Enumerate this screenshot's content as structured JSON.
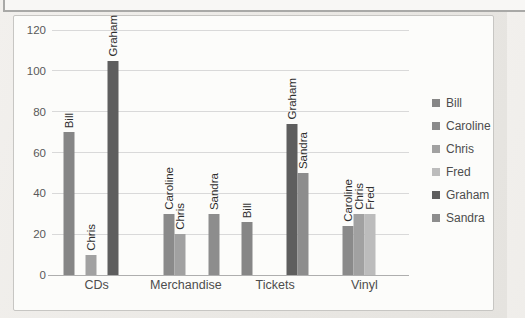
{
  "chart_data": {
    "type": "bar",
    "title": "",
    "xlabel": "",
    "ylabel": "",
    "categories": [
      "CDs",
      "Merchandise",
      "Tickets",
      "Vinyl"
    ],
    "series": [
      {
        "name": "Bill",
        "color": "#868686",
        "values": [
          70,
          null,
          26,
          null
        ]
      },
      {
        "name": "Caroline",
        "color": "#8a8a8a",
        "values": [
          null,
          30,
          null,
          24
        ]
      },
      {
        "name": "Chris",
        "color": "#a1a1a1",
        "values": [
          10,
          20,
          null,
          30
        ]
      },
      {
        "name": "Fred",
        "color": "#bcbcbc",
        "values": [
          null,
          null,
          null,
          30
        ]
      },
      {
        "name": "Graham",
        "color": "#5e5e5e",
        "values": [
          105,
          null,
          74,
          null
        ]
      },
      {
        "name": "Sandra",
        "color": "#8d8d8d",
        "values": [
          null,
          30,
          50,
          null
        ]
      }
    ],
    "y_ticks": [
      0,
      20,
      40,
      60,
      80,
      100,
      120
    ],
    "ylim": [
      0,
      120
    ],
    "grid": true,
    "legend_position": "right",
    "bar_labels": "series name rotated 90 degrees above each bar"
  }
}
